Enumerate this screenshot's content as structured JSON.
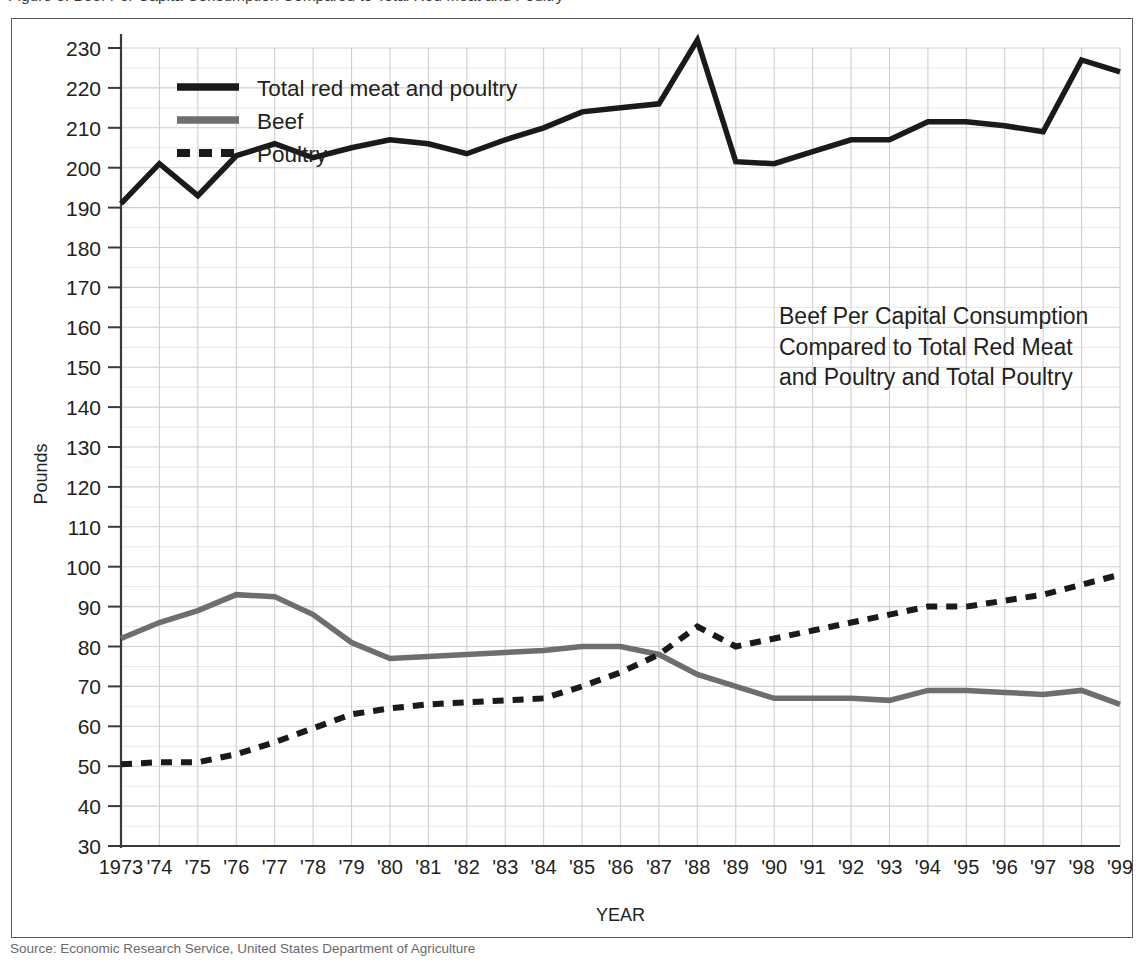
{
  "page": {
    "top_caption_clipped": "Figure 3. Beef Per Capita Consumption Compared to Total Red Meat and Poultry",
    "bottom_caption_clipped": "Source: Economic Research Service, United States Department of Agriculture"
  },
  "chart_data": {
    "type": "line",
    "title": "",
    "xlabel": "YEAR",
    "ylabel": "Pounds",
    "ylim": [
      30,
      230
    ],
    "ytick_step": 10,
    "yticks": [
      30,
      40,
      50,
      60,
      70,
      80,
      90,
      100,
      110,
      120,
      130,
      140,
      150,
      160,
      170,
      180,
      190,
      200,
      210,
      220,
      230
    ],
    "grid": true,
    "minor_grid": true,
    "legend_position": "top-left-inside",
    "categories": [
      "1973",
      "'74",
      "'75",
      "'76",
      "'77",
      "'78",
      "'79",
      "'80",
      "'81",
      "'82",
      "'83",
      "'84",
      "'85",
      "'86",
      "'87",
      "'88",
      "'89",
      "'90",
      "'91",
      "'92",
      "'93",
      "'94",
      "'95",
      "'96",
      "'97",
      "'98",
      "'99"
    ],
    "series": [
      {
        "name": "Total red meat and poultry",
        "style": "solid",
        "color": "#1a1a1a",
        "width": 5.5,
        "values": [
          191,
          201,
          193,
          203,
          206,
          202.5,
          205,
          207,
          206,
          203.5,
          207,
          210,
          214,
          215,
          216,
          232,
          201.5,
          201,
          204,
          207,
          207,
          211.5,
          211.5,
          210.5,
          209,
          227,
          224
        ]
      },
      {
        "name": "Beef",
        "style": "solid",
        "color": "#6e6e6e",
        "width": 5.5,
        "values": [
          82,
          86,
          89,
          93,
          92.5,
          88,
          81,
          77,
          77.5,
          78,
          78.5,
          79,
          80,
          80,
          78,
          73,
          70,
          67,
          67,
          67,
          66.5,
          69,
          69,
          68.5,
          68,
          69,
          65.5
        ]
      },
      {
        "name": "Poultry",
        "style": "dashed",
        "color": "#1a1a1a",
        "width": 6,
        "values": [
          50.5,
          51,
          51,
          53,
          56,
          59.5,
          63,
          64.5,
          65.5,
          66,
          66.5,
          67,
          70,
          73.5,
          78,
          85,
          80,
          82,
          84,
          86,
          88,
          90,
          90,
          91.5,
          93,
          95.5,
          98
        ]
      }
    ],
    "annotation": {
      "lines": [
        "Beef Per Capital Consumption",
        "Compared to Total Red Meat",
        "and Poultry and Total Poultry"
      ]
    }
  },
  "colors": {
    "frame": "#5a5a5e",
    "axis": "#3a3a3a",
    "major_grid": "#cfcfcf",
    "minor_grid": "#e8e8e8",
    "text": "#231f20"
  }
}
